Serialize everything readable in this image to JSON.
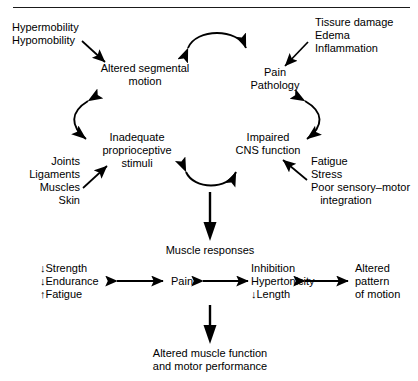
{
  "diagram": {
    "type": "flow-diagram",
    "line_color": "#000000",
    "background": "#ffffff",
    "top_rule": true,
    "nodes": {
      "hypermobility": "Hypermobility\nHypomobility",
      "altered_segmental_motion": "Altered segmental\nmotion",
      "tissue_damage": "Tissure damage\nEdema\nInflammation",
      "pain_pathology": "Pain\nPathology",
      "inadequate_proprioceptive": "Inadequate\nproprioceptive\nstimuli",
      "joints_ligaments": "Joints\nLigaments\nMuscles\nSkin",
      "impaired_cns": "Impaired\nCNS function",
      "fatigue_stress": "Fatigue\nStress\nPoor sensory–motor\n   integration",
      "muscle_responses": "Muscle responses",
      "strength_endurance": "↓Strength\n↓Endurance\n↑Fatigue",
      "pain": "Pain",
      "inhibition": "Inhibition\nHypertonicity\n↓Length",
      "altered_pattern": "Altered\npattern\nof motion",
      "altered_muscle_function": "Altered muscle function\nand motor performance"
    },
    "connectors": [
      {
        "name": "hypermobility-to-altered-motion",
        "kind": "straight-arrow"
      },
      {
        "name": "altered-motion-to-pain-pathology",
        "kind": "arc-double-arrow"
      },
      {
        "name": "tissue-damage-to-pain-pathology",
        "kind": "straight-arrow"
      },
      {
        "name": "altered-motion-to-proprioceptive",
        "kind": "curved-double-arrow-left"
      },
      {
        "name": "pain-pathology-to-cns",
        "kind": "curved-double-arrow-right"
      },
      {
        "name": "joints-to-proprioceptive",
        "kind": "straight-arrow"
      },
      {
        "name": "fatigue-to-cns",
        "kind": "straight-arrow"
      },
      {
        "name": "proprioceptive-to-cns",
        "kind": "u-double-arrow"
      },
      {
        "name": "to-muscle-responses",
        "kind": "vertical-arrow"
      },
      {
        "name": "strength-to-pain",
        "kind": "horizontal-double-arrow"
      },
      {
        "name": "pain-to-inhibition",
        "kind": "horizontal-double-arrow"
      },
      {
        "name": "inhibition-to-altered-pattern",
        "kind": "horizontal-double-arrow"
      },
      {
        "name": "to-altered-muscle-function",
        "kind": "vertical-arrow"
      }
    ]
  }
}
